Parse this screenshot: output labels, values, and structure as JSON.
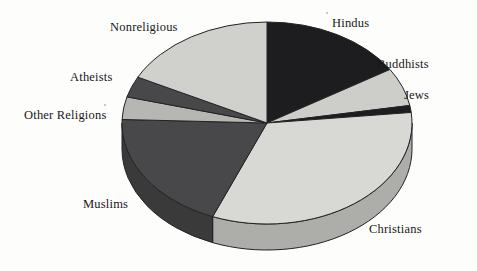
{
  "chart_data": {
    "type": "pie",
    "title": "",
    "subtitle": "",
    "xlabel": "",
    "ylabel": "",
    "legend_position": "none",
    "grid": false,
    "style": "3d-exploded-disc",
    "start_angle_deg": 0,
    "direction": "clockwise",
    "labels_placement": "outside-with-leader-implied",
    "categories": [
      "Hindus",
      "Buddhists",
      "Jews",
      "Christians",
      "Muslims",
      "Other Religions",
      "Atheists",
      "Nonreligious"
    ],
    "values": [
      16.1,
      6.1,
      1.1,
      32.8,
      19.4,
      3.6,
      3.3,
      17.6
    ],
    "units": "percent",
    "slices": [
      {
        "label": "Hindus",
        "value": 16.1,
        "start_deg": 0.0,
        "end_deg": 58.0,
        "color": "#1d1d1f"
      },
      {
        "label": "Buddhists",
        "value": 6.1,
        "start_deg": 58.0,
        "end_deg": 80.0,
        "color": "#cdcdc9"
      },
      {
        "label": "Jews",
        "value": 1.1,
        "start_deg": 80.0,
        "end_deg": 84.0,
        "color": "#1d1d1f"
      },
      {
        "label": "Christians",
        "value": 32.8,
        "start_deg": 84.0,
        "end_deg": 202.0,
        "color": "#d8d8d4"
      },
      {
        "label": "Muslims",
        "value": 19.4,
        "start_deg": 202.0,
        "end_deg": 272.0,
        "color": "#48484a"
      },
      {
        "label": "Other Religions",
        "value": 3.6,
        "start_deg": 272.0,
        "end_deg": 285.0,
        "color": "#b6b6b2"
      },
      {
        "label": "Atheists",
        "value": 3.3,
        "start_deg": 285.0,
        "end_deg": 297.0,
        "color": "#48484a"
      },
      {
        "label": "Nonreligious",
        "value": 17.6,
        "start_deg": 297.0,
        "end_deg": 360.0,
        "color": "#d0d0cc"
      }
    ]
  },
  "labels": {
    "hindus": "Hindus",
    "buddhists": "Buddhists",
    "jews": "Jews",
    "christians": "Christians",
    "muslims": "Muslims",
    "other_religions": "Other Religions",
    "atheists": "Atheists",
    "nonreligious": "Nonreligious"
  },
  "colors": {
    "background": "#fdfdfc",
    "outline": "#232326",
    "dark_slice": "#1d1d1f",
    "mid_slice": "#48484a",
    "light_slice": "#d8d8d4",
    "pale_slice": "#cdcdc9",
    "muted_slice": "#b6b6b2",
    "text": "#17171a"
  },
  "geometry": {
    "center_x": 267,
    "center_y": 123,
    "radius_x": 145,
    "radius_y": 101,
    "depth": 26
  }
}
